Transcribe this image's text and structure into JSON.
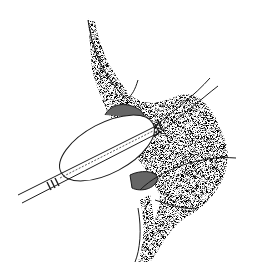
{
  "image": {
    "subject": "Stippled medical illustration of a balloon catheter inflated inside a vessel lumen",
    "width": 256,
    "height": 272,
    "colors": {
      "background": "#ffffff",
      "ink": "#1a1a1a",
      "stipple": "#3a3a3a"
    }
  }
}
